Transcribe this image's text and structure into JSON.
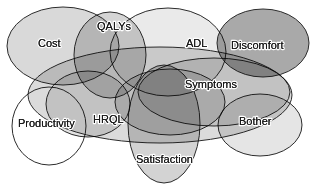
{
  "figure": {
    "type": "venn-diagram",
    "background_color": "#ffffff",
    "stroke_color": "#2b2b2b",
    "label_color": "#1a1a1a"
  },
  "sets": [
    {
      "id": "cost",
      "label": "Cost",
      "fill": "#d2d2d2",
      "opacity": 0.85,
      "cx": 63,
      "cy": 46,
      "rx": 56,
      "ry": 39,
      "rotate": 0,
      "label_x": 38,
      "label_y": 44
    },
    {
      "id": "qalys",
      "label": "QALYs",
      "fill": "#cbcbcb",
      "opacity": 0.8,
      "cx": 110,
      "cy": 55,
      "rx": 36,
      "ry": 43,
      "rotate": 0,
      "label_x": 97,
      "label_y": 27
    },
    {
      "id": "adl",
      "label": "ADL",
      "fill": "#e6e6e6",
      "opacity": 0.85,
      "cx": 168,
      "cy": 52,
      "rx": 58,
      "ry": 44,
      "rotate": 0,
      "label_x": 186,
      "label_y": 44
    },
    {
      "id": "discomfort",
      "label": "Discomfort",
      "fill": "#a0a0a0",
      "opacity": 0.9,
      "cx": 263,
      "cy": 43,
      "rx": 46,
      "ry": 34,
      "rotate": 0,
      "label_x": 231,
      "label_y": 46
    },
    {
      "id": "symptoms",
      "label": "Symptoms",
      "fill": "#d8d8d8",
      "opacity": 0.75,
      "cx": 214,
      "cy": 92,
      "rx": 76,
      "ry": 34,
      "rotate": 0,
      "label_x": 185,
      "label_y": 85
    },
    {
      "id": "hrql",
      "label": "HRQL",
      "fill": "#cfcfcf",
      "opacity": 0.75,
      "cx": 160,
      "cy": 95,
      "rx": 132,
      "ry": 48,
      "rotate": 0,
      "label_x": 93,
      "label_y": 120
    },
    {
      "id": "productivity",
      "label": "Productivity",
      "fill": "#ffffff",
      "opacity": 0.0,
      "cx": 49,
      "cy": 126,
      "rx": 37,
      "ry": 39,
      "rotate": 0,
      "label_x": 18,
      "label_y": 124
    },
    {
      "id": "satisfaction",
      "label": "Satisfaction",
      "fill": "#c4c4c4",
      "opacity": 0.75,
      "cx": 164,
      "cy": 124,
      "rx": 36,
      "ry": 59,
      "rotate": 0,
      "label_x": 136,
      "label_y": 160
    },
    {
      "id": "bother",
      "label": "Bother",
      "fill": "#dadada",
      "opacity": 0.7,
      "cx": 260,
      "cy": 125,
      "rx": 42,
      "ry": 31,
      "rotate": 0,
      "label_x": 239,
      "label_y": 122
    },
    {
      "id": "inner-upper-left",
      "label": "",
      "fill": "#cacaca",
      "opacity": 0.55,
      "cx": 88,
      "cy": 104,
      "rx": 42,
      "ry": 33,
      "rotate": 0,
      "label_x": 0,
      "label_y": 0
    },
    {
      "id": "inner-center",
      "label": "",
      "fill": "#c6c6c6",
      "opacity": 0.55,
      "cx": 170,
      "cy": 102,
      "rx": 55,
      "ry": 33,
      "rotate": 0,
      "label_x": 0,
      "label_y": 0
    }
  ],
  "labels_order": [
    "Cost",
    "QALYs",
    "ADL",
    "Discomfort",
    "Symptoms",
    "HRQL",
    "Productivity",
    "Satisfaction",
    "Bother"
  ]
}
